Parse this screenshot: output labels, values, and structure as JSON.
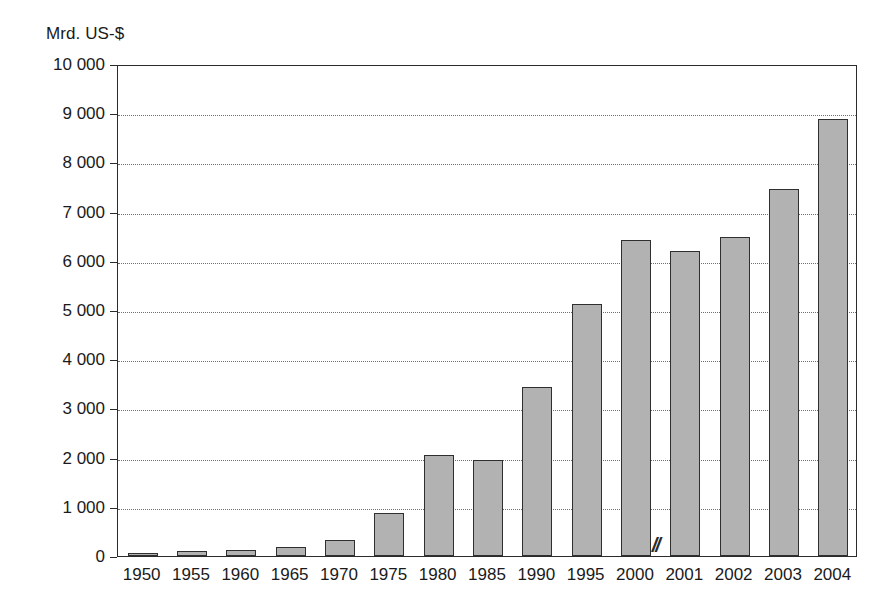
{
  "chart_data": {
    "type": "bar",
    "title": "",
    "subtitle": "",
    "xlabel": "",
    "ylabel": "Mrd. US-$",
    "unit_label": "Mrd. US-$",
    "categories": [
      "1950",
      "1955",
      "1960",
      "1965",
      "1970",
      "1975",
      "1980",
      "1985",
      "1990",
      "1995",
      "2000",
      "2001",
      "2002",
      "2003",
      "2004"
    ],
    "values": [
      62,
      95,
      130,
      190,
      330,
      880,
      2050,
      1960,
      3440,
      5130,
      6430,
      6190,
      6480,
      7450,
      8880
    ],
    "series": [
      {
        "name": "Mrd. US-$",
        "values": [
          62,
          95,
          130,
          190,
          330,
          880,
          2050,
          1960,
          3440,
          5130,
          6430,
          6190,
          6480,
          7450,
          8880
        ]
      }
    ],
    "ylim": [
      0,
      10000
    ],
    "ytick_values": [
      0,
      1000,
      2000,
      3000,
      4000,
      5000,
      6000,
      7000,
      8000,
      9000,
      10000
    ],
    "ytick_labels": [
      "0",
      "1 000",
      "2 000",
      "3 000",
      "4 000",
      "5 000",
      "6 000",
      "7 000",
      "8 000",
      "9 000",
      "10 000"
    ],
    "grid": "horizontal-dotted",
    "legend": "none",
    "legend_position": "none",
    "annotations": [
      {
        "name": "axis-break",
        "text": "//",
        "between": [
          "2000",
          "2001"
        ]
      }
    ],
    "colors": {
      "bar_fill": "#b2b2b2",
      "bar_border": "#2f2f2f",
      "axis": "#2b2b2b",
      "gridline": "#6f6f6f",
      "text": "#1a1a1a",
      "background": "#ffffff"
    }
  }
}
